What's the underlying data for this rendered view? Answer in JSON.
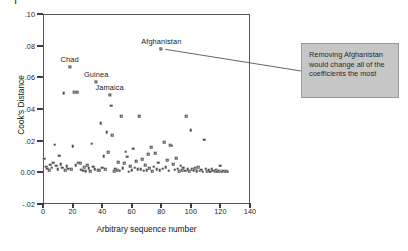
{
  "figure": {
    "clipped_caption_glyph": "F",
    "background": "#ffffff"
  },
  "annotation": {
    "text": "Removing Afghanistan would change all of the coefficients the most",
    "fill_color": "#c6c6c6",
    "border_color": "#9a9a9a",
    "leader_line_color": "#555555"
  },
  "chart_data": {
    "type": "scatter",
    "title": "",
    "xlabel": "Arbitrary sequence number",
    "ylabel": "Cook's Distance",
    "xlim": [
      0,
      140
    ],
    "ylim": [
      -0.02,
      0.1
    ],
    "grid": false,
    "legend": null,
    "xticks": [
      0,
      20,
      40,
      60,
      80,
      100,
      120,
      140
    ],
    "xtick_labels": [
      "0",
      "20",
      "40",
      "60",
      "80",
      "100",
      "120",
      "140"
    ],
    "yticks": [
      -0.02,
      0.0,
      0.02,
      0.04,
      0.06,
      0.08,
      0.1
    ],
    "ytick_labels": [
      "-.02",
      "0.00",
      ".02",
      ".04",
      ".06",
      ".08",
      ".10"
    ],
    "marker": "open-square",
    "marker_color": "#4d4d4d",
    "annotations": [
      {
        "label": "Chad",
        "x": 18,
        "y": 0.0665
      },
      {
        "label": "Guinea",
        "x": 36,
        "y": 0.057
      },
      {
        "label": "Jamaica",
        "x": 45,
        "y": 0.049
      },
      {
        "label": "Afghanistan",
        "x": 80,
        "y": 0.078
      }
    ],
    "points": [
      [
        1,
        0.0085
      ],
      [
        2,
        0.0035
      ],
      [
        3,
        0.0022
      ],
      [
        4,
        0.0012
      ],
      [
        5,
        0.0048
      ],
      [
        6,
        0.0028
      ],
      [
        7,
        0.006
      ],
      [
        8,
        0.0175
      ],
      [
        9,
        0.0042
      ],
      [
        10,
        0.0018
      ],
      [
        11,
        0.0105
      ],
      [
        12,
        0.0052
      ],
      [
        13,
        0.003
      ],
      [
        14,
        0.05
      ],
      [
        15,
        0.0014
      ],
      [
        16,
        0.0038
      ],
      [
        17,
        0.0024
      ],
      [
        18,
        0.0665
      ],
      [
        19,
        0.002
      ],
      [
        20,
        0.0165
      ],
      [
        21,
        0.0505
      ],
      [
        22,
        0.0045
      ],
      [
        23,
        0.0505
      ],
      [
        24,
        0.0062
      ],
      [
        25,
        0.0058
      ],
      [
        26,
        0.0016
      ],
      [
        27,
        0.001
      ],
      [
        28,
        0.0032
      ],
      [
        29,
        0.0008
      ],
      [
        30,
        0.0044
      ],
      [
        31,
        0.0026
      ],
      [
        32,
        0.0006
      ],
      [
        33,
        0.018
      ],
      [
        34,
        0.0036
      ],
      [
        35,
        0.002
      ],
      [
        36,
        0.057
      ],
      [
        37,
        0.0014
      ],
      [
        38,
        0.0012
      ],
      [
        39,
        0.031
      ],
      [
        40,
        0.003
      ],
      [
        41,
        0.0102
      ],
      [
        42,
        0.0018
      ],
      [
        43,
        0.0255
      ],
      [
        44,
        0.0128
      ],
      [
        45,
        0.049
      ],
      [
        46,
        0.042
      ],
      [
        47,
        0.0235
      ],
      [
        48,
        0.0008
      ],
      [
        49,
        0.0022
      ],
      [
        50,
        0.0015
      ],
      [
        51,
        0.0064
      ],
      [
        52,
        0.001
      ],
      [
        53,
        0.0355
      ],
      [
        54,
        0.0026
      ],
      [
        55,
        0.0056
      ],
      [
        56,
        0.013
      ],
      [
        57,
        0.0098
      ],
      [
        58,
        0.0005
      ],
      [
        59,
        0.004
      ],
      [
        60,
        0.0012
      ],
      [
        61,
        0.0148
      ],
      [
        62,
        0.003
      ],
      [
        63,
        0.0072
      ],
      [
        64,
        0.0018
      ],
      [
        65,
        0.0355
      ],
      [
        66,
        0.002
      ],
      [
        67,
        0.0084
      ],
      [
        68,
        0.001
      ],
      [
        69,
        0.0046
      ],
      [
        70,
        0.0014
      ],
      [
        71,
        0.0115
      ],
      [
        72,
        0.0026
      ],
      [
        73,
        0.016
      ],
      [
        74,
        0.0008
      ],
      [
        75,
        0.0035
      ],
      [
        76,
        0.012
      ],
      [
        77,
        0.0018
      ],
      [
        78,
        0.006
      ],
      [
        79,
        0.0012
      ],
      [
        80,
        0.078
      ],
      [
        81,
        0.0022
      ],
      [
        82,
        0.019
      ],
      [
        83,
        0.0032
      ],
      [
        84,
        0.0076
      ],
      [
        85,
        0.001
      ],
      [
        86,
        0.017
      ],
      [
        87,
        0.0168
      ],
      [
        88,
        0.005
      ],
      [
        89,
        0.0016
      ],
      [
        90,
        0.0088
      ],
      [
        91,
        0.0024
      ],
      [
        92,
        0.0006
      ],
      [
        93,
        0.0042
      ],
      [
        94,
        0.0014
      ],
      [
        95,
        0.003
      ],
      [
        96,
        0.001
      ],
      [
        97,
        0.0355
      ],
      [
        98,
        0.0018
      ],
      [
        99,
        0.0008
      ],
      [
        100,
        0.0265
      ],
      [
        101,
        0.002
      ],
      [
        102,
        0.0012
      ],
      [
        103,
        0.0026
      ],
      [
        104,
        0.0006
      ],
      [
        105,
        0.0034
      ],
      [
        106,
        0.001
      ],
      [
        107,
        0.0016
      ],
      [
        108,
        0.0005
      ],
      [
        109,
        0.0206
      ],
      [
        110,
        0.0022
      ],
      [
        111,
        0.0008
      ],
      [
        112,
        0.0014
      ],
      [
        113,
        0.0004
      ],
      [
        114,
        0.0018
      ],
      [
        115,
        0.001
      ],
      [
        116,
        0.0006
      ],
      [
        117,
        0.0012
      ],
      [
        118,
        0.0003
      ],
      [
        119,
        0.0008
      ],
      [
        120,
        0.0042
      ],
      [
        121,
        0.0005
      ],
      [
        122,
        0.001
      ],
      [
        123,
        0.0004
      ],
      [
        124,
        0.0007
      ],
      [
        125,
        0.0003
      ]
    ]
  }
}
